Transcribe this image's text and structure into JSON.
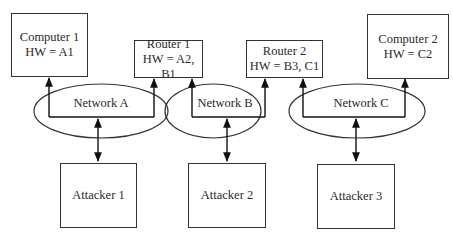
{
  "nodes": {
    "computer1": {
      "name": "Computer 1",
      "hw": "HW = A1"
    },
    "router1": {
      "name": "Router 1",
      "hw": "HW = A2, B1"
    },
    "router2": {
      "name": "Router 2",
      "hw": "HW = B3, C1"
    },
    "computer2": {
      "name": "Computer 2",
      "hw": "HW = C2"
    },
    "attacker1": {
      "name": "Attacker 1"
    },
    "attacker2": {
      "name": "Attacker 2"
    },
    "attacker3": {
      "name": "Attacker 3"
    }
  },
  "networks": {
    "a": {
      "label": "Network A"
    },
    "b": {
      "label": "Network B"
    },
    "c": {
      "label": "Network C"
    }
  },
  "edges": [
    {
      "from": "network-a",
      "to": "computer1",
      "type": "arrow"
    },
    {
      "from": "network-a",
      "to": "router1",
      "type": "arrow"
    },
    {
      "from": "network-b",
      "to": "router1",
      "type": "arrow"
    },
    {
      "from": "network-b",
      "to": "router2",
      "type": "arrow"
    },
    {
      "from": "network-c",
      "to": "router2",
      "type": "arrow"
    },
    {
      "from": "network-c",
      "to": "computer2",
      "type": "arrow"
    },
    {
      "from": "network-a",
      "to": "attacker1",
      "type": "bidirectional"
    },
    {
      "from": "network-b",
      "to": "attacker2",
      "type": "bidirectional"
    },
    {
      "from": "network-c",
      "to": "attacker3",
      "type": "bidirectional"
    }
  ]
}
